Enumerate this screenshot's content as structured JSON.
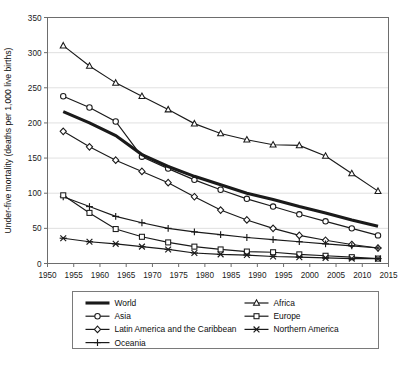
{
  "chart_data": {
    "type": "line",
    "title": "",
    "xlabel": "",
    "ylabel": "Under-five mortality (deaths per 1,000 live births)",
    "xlim": [
      1950,
      2015
    ],
    "ylim": [
      0,
      350
    ],
    "yticks": [
      0,
      50,
      100,
      150,
      200,
      250,
      300,
      350
    ],
    "xticks": [
      1950,
      1955,
      1960,
      1965,
      1970,
      1975,
      1980,
      1985,
      1990,
      1995,
      2000,
      2005,
      2010,
      2015
    ],
    "grid": true,
    "legend_position": "bottom",
    "x": [
      1953,
      1958,
      1963,
      1968,
      1973,
      1978,
      1983,
      1988,
      1993,
      1998,
      2003,
      2008,
      2013
    ],
    "series": [
      {
        "name": "World",
        "marker": "none",
        "linewidth": "thick",
        "values": [
          216,
          200,
          182,
          155,
          138,
          124,
          112,
          100,
          91,
          81,
          72,
          62,
          53
        ]
      },
      {
        "name": "Africa",
        "marker": "triangle",
        "linewidth": "thin",
        "values": [
          310,
          281,
          257,
          238,
          219,
          199,
          185,
          176,
          169,
          168,
          153,
          128,
          103
        ]
      },
      {
        "name": "Asia",
        "marker": "circle",
        "linewidth": "thin",
        "values": [
          238,
          222,
          202,
          152,
          135,
          119,
          105,
          92,
          81,
          70,
          60,
          50,
          40
        ]
      },
      {
        "name": "Europe",
        "marker": "square",
        "linewidth": "thin",
        "values": [
          97,
          72,
          49,
          38,
          30,
          24,
          20,
          17,
          16,
          13,
          11,
          9,
          7
        ]
      },
      {
        "name": "Latin America and the Caribbean",
        "marker": "diamond",
        "linewidth": "thin",
        "values": [
          188,
          166,
          147,
          131,
          115,
          95,
          76,
          62,
          50,
          40,
          33,
          27,
          22
        ]
      },
      {
        "name": "Northern America",
        "marker": "x",
        "linewidth": "thin",
        "values": [
          36,
          31,
          28,
          24,
          20,
          15,
          13,
          12,
          10,
          9,
          8,
          7,
          7
        ]
      },
      {
        "name": "Oceania",
        "marker": "plus",
        "linewidth": "thin",
        "values": [
          95,
          81,
          67,
          58,
          50,
          45,
          41,
          37,
          34,
          31,
          28,
          25,
          22
        ]
      }
    ]
  },
  "legend": {
    "column_left": [
      "World",
      "Asia",
      "Latin America and the Caribbean",
      "Oceania"
    ],
    "column_right": [
      "Africa",
      "Europe",
      "Northern America"
    ]
  },
  "axis": {
    "y_title": "Under-five mortality (deaths per 1,000 live births)",
    "y_tick_labels": [
      "0",
      "50",
      "100",
      "150",
      "200",
      "250",
      "300",
      "350"
    ],
    "x_tick_labels": [
      "1950",
      "1955",
      "1960",
      "1965",
      "1970",
      "1975",
      "1980",
      "1985",
      "1990",
      "1995",
      "2000",
      "2005",
      "2010",
      "2015"
    ]
  },
  "colors": {
    "line": "#1a1a1a",
    "grid": "#d8d8d8",
    "axis": "#6d6d6d",
    "background": "#ffffff"
  }
}
